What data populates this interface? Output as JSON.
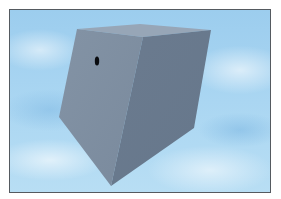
{
  "scene": {
    "description": "3D rendered gray block with a small hole against a cloudy sky",
    "colors": {
      "border": "#555a60",
      "sky": "#a6d4f1",
      "left_face": "#7f8fa1",
      "right_face": "#6d7d91",
      "top_face": "#95a4b5",
      "hole": "#0a0c10"
    },
    "block": {
      "top_face": [
        [
          77,
          29
        ],
        [
          140,
          24
        ],
        [
          211,
          30
        ],
        [
          143,
          37
        ]
      ],
      "left_face": [
        [
          77,
          29
        ],
        [
          143,
          37
        ],
        [
          111,
          186
        ],
        [
          59,
          117
        ]
      ],
      "right_face": [
        [
          143,
          37
        ],
        [
          211,
          30
        ],
        [
          194,
          128
        ],
        [
          111,
          186
        ]
      ]
    },
    "hole": {
      "cx": 97,
      "cy": 61,
      "rx": 2.2,
      "ry": 4.5
    }
  }
}
